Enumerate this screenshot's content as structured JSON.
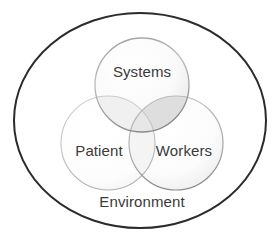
{
  "diagram": {
    "type": "venn-3-circle-with-container",
    "container": {
      "shape": "ellipse",
      "label": "Environment",
      "label_position": "bottom-inside",
      "stroke_color": "#2b2b2b",
      "stroke_width": 2,
      "fill_color": "#ffffff",
      "cx": 140,
      "cy": 120.5,
      "rx": 126,
      "ry": 107.5
    },
    "circles": [
      {
        "id": "systems",
        "label": "Systems",
        "position": "top-center",
        "cx": 142,
        "cy": 85,
        "r": 47,
        "stroke_color": "#9a9a9a",
        "fill_color": "#f4f4f4",
        "label_x": 142,
        "label_y": 72
      },
      {
        "id": "patient",
        "label": "Patient",
        "position": "bottom-left",
        "cx": 108,
        "cy": 143,
        "r": 47,
        "stroke_color": "#b8b8b8",
        "fill_color": "#fbfbfb",
        "label_x": 99,
        "label_y": 152
      },
      {
        "id": "workers",
        "label": "Workers",
        "position": "bottom-right",
        "cx": 176,
        "cy": 143,
        "r": 47,
        "stroke_color": "#a8a8a8",
        "fill_color": "#f7f7f7",
        "label_x": 184,
        "label_y": 152
      }
    ],
    "intersections": [
      {
        "id": "systems-workers",
        "members": [
          "systems",
          "workers"
        ],
        "shade": "#dcdcdc"
      },
      {
        "id": "systems-patient",
        "members": [
          "systems",
          "patient"
        ],
        "shade": "#eeeeee"
      },
      {
        "id": "patient-workers",
        "members": [
          "patient",
          "workers"
        ],
        "shade": "#f0f0f0"
      },
      {
        "id": "all-three",
        "members": [
          "systems",
          "patient",
          "workers"
        ],
        "shade": "#e6e6e6"
      }
    ],
    "colors": {
      "outer_stroke": "#2b2b2b",
      "text": "#3a3a3a",
      "background": "#ffffff",
      "circle_stroke_light": "#b8b8b8",
      "circle_stroke_dark": "#8f8f8f"
    }
  }
}
